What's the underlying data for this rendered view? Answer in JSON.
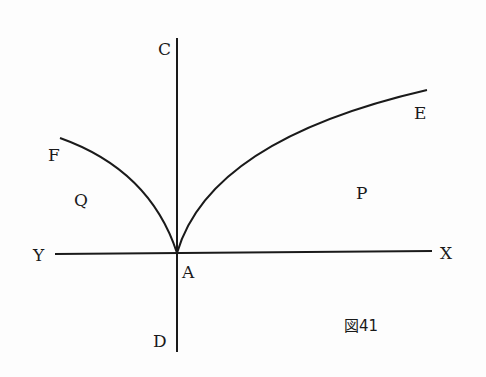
{
  "figure": {
    "caption": "図41",
    "labels": {
      "C": "C",
      "D": "D",
      "X": "X",
      "Y": "Y",
      "A": "A",
      "E": "E",
      "F": "F",
      "P": "P",
      "Q": "Q"
    }
  },
  "colors": {
    "ink": "#1a1a1a",
    "paper": "#fdfdfd"
  }
}
